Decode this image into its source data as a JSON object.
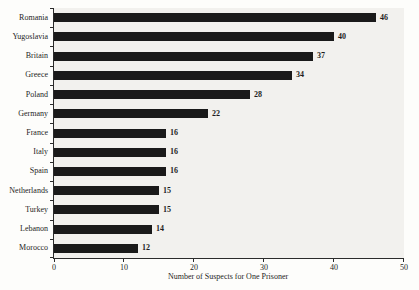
{
  "chart_data": {
    "type": "bar",
    "orientation": "horizontal",
    "title": "",
    "xlabel": "Number of Suspects for One Prisoner",
    "ylabel": "",
    "categories": [
      "Romania",
      "Yugoslavia",
      "Britain",
      "Greece",
      "Poland",
      "Germany",
      "France",
      "Italy",
      "Spain",
      "Netherlands",
      "Turkey",
      "Lebanon",
      "Morocco"
    ],
    "values": [
      46,
      40,
      37,
      34,
      28,
      22,
      16,
      16,
      16,
      15,
      15,
      14,
      12
    ],
    "xlim": [
      0,
      50
    ],
    "xticks": [
      0,
      10,
      20,
      30,
      40,
      50
    ],
    "bar_color": "#1a1a1a",
    "plot_background": "#f2f1ee",
    "grid": false,
    "legend": false,
    "value_labels_shown": true
  }
}
